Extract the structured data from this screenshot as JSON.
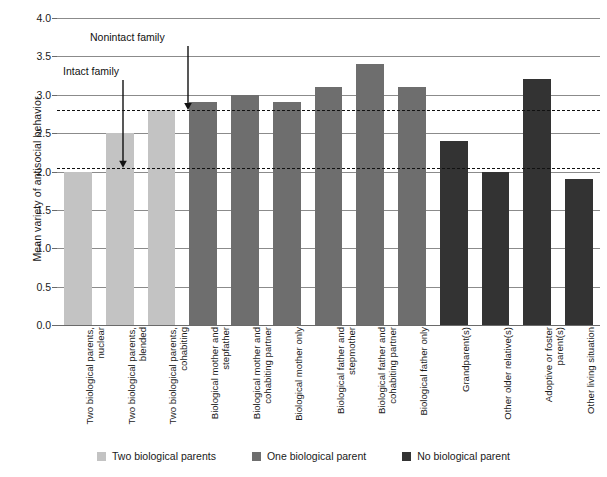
{
  "chart_data": {
    "type": "bar",
    "title": "",
    "xlabel": "",
    "ylabel": "Mean variety of antisocial behavior",
    "ylim": [
      0.0,
      4.0
    ],
    "ytick_step": 0.5,
    "ytick_labels": [
      "0.0",
      "0.5",
      "1.0",
      "1.5",
      "2.0",
      "2.5",
      "3.0",
      "3.5",
      "4.0"
    ],
    "grid": true,
    "legend_position": "bottom-center",
    "categories": [
      "Two biological parents, nuclear",
      "Two biological parents, blended",
      "Two biological parents, cohabiting",
      "Biological mother and stepfather",
      "Biological mother and cohabiting partner",
      "Biological mother only",
      "Biological father and stepmother",
      "Biological father and cohabiting partner",
      "Biological father only",
      "Grandparent(s)",
      "Other older relative(s)",
      "Adoptive or foster parent(s)",
      "Other living situation"
    ],
    "values": [
      2.0,
      2.5,
      2.8,
      2.9,
      3.0,
      2.9,
      3.1,
      3.4,
      3.1,
      2.4,
      2.0,
      3.2,
      1.9
    ],
    "group_of_bar": [
      "Two biological parents",
      "Two biological parents",
      "Two biological parents",
      "One biological parent",
      "One biological parent",
      "One biological parent",
      "One biological parent",
      "One biological parent",
      "One biological parent",
      "No biological parent",
      "No biological parent",
      "No biological parent",
      "No biological parent"
    ],
    "reference_lines": [
      {
        "label": "Intact family",
        "value": 2.05
      },
      {
        "label": "Nonintact family",
        "value": 2.8
      }
    ],
    "annotations": [
      {
        "text": "Intact family",
        "points_to_value": 2.05
      },
      {
        "text": "Nonintact family",
        "points_to_value": 2.8
      }
    ]
  },
  "legend": {
    "items": [
      {
        "label": "Two biological parents",
        "color": "#c3c3c3"
      },
      {
        "label": "One biological parent",
        "color": "#6e6e6e"
      },
      {
        "label": "No biological parent",
        "color": "#333333"
      }
    ]
  },
  "colors": {
    "two_biological_parents": "#c3c3c3",
    "one_biological_parent": "#6e6e6e",
    "no_biological_parent": "#333333",
    "gridline": "#8b8b8b",
    "refline": "#111111",
    "text": "#1a1a1a"
  }
}
